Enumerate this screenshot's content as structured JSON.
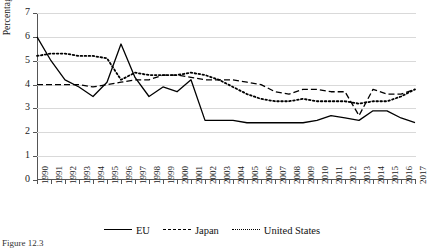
{
  "figure": {
    "caption": "Figure 12.3"
  },
  "axis": {
    "ylabel": "Percentage",
    "yticks": [
      "0",
      "1",
      "2",
      "3",
      "4",
      "5",
      "6",
      "7"
    ],
    "xlabel": ""
  },
  "legend": {
    "position": "bottom-center",
    "items": [
      {
        "label": "EU",
        "style": "solid"
      },
      {
        "label": "Japan",
        "style": "dashed"
      },
      {
        "label": "United States",
        "style": "dotted"
      }
    ]
  },
  "chart_data": {
    "type": "line",
    "title": "",
    "xlabel": "",
    "ylabel": "Percentage",
    "ylim": [
      0,
      7
    ],
    "grid": true,
    "x": [
      1990,
      1991,
      1992,
      1993,
      1994,
      1995,
      1996,
      1997,
      1998,
      1999,
      2000,
      2001,
      2002,
      2003,
      2004,
      2005,
      2006,
      2007,
      2008,
      2009,
      2010,
      2011,
      2012,
      2013,
      2014,
      2015,
      2016,
      2017
    ],
    "series": [
      {
        "name": "EU",
        "style": "solid",
        "values": [
          6.0,
          5.0,
          4.2,
          3.9,
          3.5,
          4.1,
          5.7,
          4.3,
          3.5,
          3.9,
          3.7,
          4.2,
          2.5,
          2.5,
          2.5,
          2.4,
          2.4,
          2.4,
          2.4,
          2.4,
          2.5,
          2.7,
          2.6,
          2.5,
          2.9,
          2.9,
          2.6,
          2.4
        ]
      },
      {
        "name": "Japan",
        "style": "dashed",
        "values": [
          4.0,
          4.0,
          4.0,
          4.0,
          3.9,
          4.0,
          4.1,
          4.2,
          4.2,
          4.4,
          4.4,
          4.3,
          4.2,
          4.2,
          4.2,
          4.1,
          4.0,
          3.7,
          3.6,
          3.8,
          3.8,
          3.7,
          3.7,
          2.7,
          3.8,
          3.6,
          3.6,
          3.8
        ]
      },
      {
        "name": "United States",
        "style": "dotted",
        "values": [
          5.2,
          5.3,
          5.3,
          5.2,
          5.2,
          5.1,
          4.2,
          4.5,
          4.4,
          4.4,
          4.4,
          4.5,
          4.4,
          4.2,
          3.9,
          3.6,
          3.4,
          3.3,
          3.3,
          3.4,
          3.3,
          3.3,
          3.3,
          3.2,
          3.3,
          3.3,
          3.5,
          3.8
        ]
      }
    ]
  }
}
